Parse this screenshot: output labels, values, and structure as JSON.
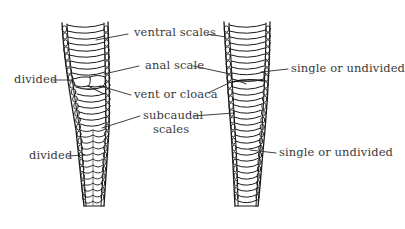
{
  "diagram": {
    "colors": {
      "ink": "#1a1a1a",
      "text": "#3a3a3a",
      "background": "#ffffff"
    },
    "left_specimen": {
      "labels": {
        "divided_anal": "divided",
        "divided_subcaudal": "divided"
      }
    },
    "center_labels": {
      "ventral_scales": "ventral scales",
      "anal_scale": "anal scale",
      "vent_or_cloaca": "vent or cloaca",
      "subcaudal_line1": "subcaudal",
      "subcaudal_line2": "scales"
    },
    "right_specimen": {
      "labels": {
        "single_anal": "single or undivided",
        "single_subcaudal": "single or undivided"
      }
    }
  }
}
